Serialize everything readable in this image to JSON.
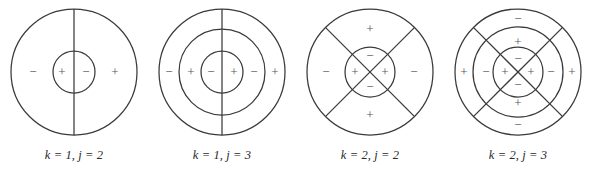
{
  "figure": {
    "background_color": "#ffffff",
    "stroke_color": "#3a3a3a",
    "sign_color": "#55555a",
    "caption_color": "#2b2b2b",
    "panels": [
      {
        "id": "panel-k1-j2",
        "caption": "k = 1, j = 2",
        "k": 1,
        "j": 2,
        "circle_count": 2,
        "radii": [
          21,
          63
        ],
        "divider": "vertical",
        "diagonals": false,
        "signs_horizontal": [
          "−",
          "+",
          "−",
          "+"
        ],
        "signs_vertical": [],
        "signs": {
          "left_outer": "−",
          "left_inner": "+",
          "right_inner": "−",
          "right_outer": "+"
        }
      },
      {
        "id": "panel-k1-j3",
        "caption": "k = 1, j = 3",
        "k": 1,
        "j": 3,
        "circle_count": 3,
        "radii": [
          21,
          43,
          63
        ],
        "divider": "vertical",
        "diagonals": false,
        "signs_horizontal": [
          "−",
          "+",
          "−",
          "+",
          "−",
          "+"
        ],
        "signs_vertical": [],
        "signs": {
          "left_outer": "−",
          "left_middle": "+",
          "left_inner": "−",
          "right_inner": "+",
          "right_middle": "−",
          "right_outer": "+"
        }
      },
      {
        "id": "panel-k2-j2",
        "caption": "k = 2, j = 2",
        "k": 2,
        "j": 2,
        "circle_count": 2,
        "radii": [
          25,
          63
        ],
        "divider": "none",
        "diagonals": true,
        "signs_horizontal": [
          "−",
          "+",
          "+",
          "−"
        ],
        "signs_vertical": [
          "+",
          "−",
          "−",
          "+"
        ],
        "signs": {
          "left_outer": "−",
          "left_inner": "+",
          "right_inner": "+",
          "right_outer": "−",
          "top_outer": "+",
          "top_inner": "−",
          "bottom_inner": "−",
          "bottom_outer": "+"
        }
      },
      {
        "id": "panel-k2-j3",
        "caption": "k = 2, j = 3",
        "k": 2,
        "j": 3,
        "circle_count": 3,
        "radii": [
          25,
          45,
          63
        ],
        "divider": "none",
        "diagonals": true,
        "signs_horizontal": [
          "+",
          "−",
          "+",
          "+",
          "−",
          "+"
        ],
        "signs_vertical": [
          "−",
          "+",
          "−",
          "−",
          "+",
          "−"
        ],
        "signs": {
          "left_outer": "+",
          "left_middle": "−",
          "left_inner": "+",
          "right_inner": "+",
          "right_middle": "−",
          "right_outer": "+",
          "top_outer": "−",
          "top_middle": "+",
          "top_inner": "−",
          "bottom_inner": "−",
          "bottom_middle": "+",
          "bottom_outer": "−"
        }
      }
    ]
  }
}
